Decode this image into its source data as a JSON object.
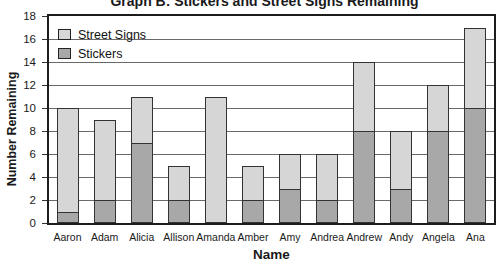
{
  "title": "Graph B: Stickers and Street Signs Remaining",
  "chart_data": {
    "type": "bar",
    "stacked": true,
    "title": "Graph B: Stickers and Street Signs Remaining",
    "xlabel": "Name",
    "ylabel": "Number Remaining",
    "ylim": [
      0,
      18
    ],
    "yticks": [
      0,
      2,
      4,
      6,
      8,
      10,
      12,
      14,
      16,
      18
    ],
    "grid": true,
    "legend_position": "top-left",
    "categories": [
      "Aaron",
      "Adam",
      "Alicia",
      "Allison",
      "Amanda",
      "Amber",
      "Amy",
      "Andrea",
      "Andrew",
      "Andy",
      "Angela",
      "Ana"
    ],
    "series": [
      {
        "name": "Stickers",
        "color": "#a8a8a8",
        "values": [
          1,
          2,
          7,
          2,
          0,
          2,
          3,
          2,
          8,
          3,
          8,
          10
        ]
      },
      {
        "name": "Street Signs",
        "color": "#d6d6d6",
        "values": [
          9,
          7,
          4,
          3,
          11,
          3,
          3,
          4,
          6,
          5,
          4,
          7
        ]
      }
    ],
    "totals": [
      10,
      9,
      11,
      5,
      11,
      5,
      6,
      6,
      14,
      8,
      12,
      17
    ]
  },
  "legend": {
    "entries": [
      {
        "label": "Street Signs",
        "color": "#d6d6d6"
      },
      {
        "label": "Stickers",
        "color": "#a8a8a8"
      }
    ]
  },
  "colors": {
    "street_signs": "#d6d6d6",
    "stickers": "#a8a8a8",
    "bar_border": "#333333",
    "gridline": "#6a6a6a",
    "plot_border": "#1c1c1c",
    "text": "#1a1a1a",
    "background": "#ffffff"
  }
}
